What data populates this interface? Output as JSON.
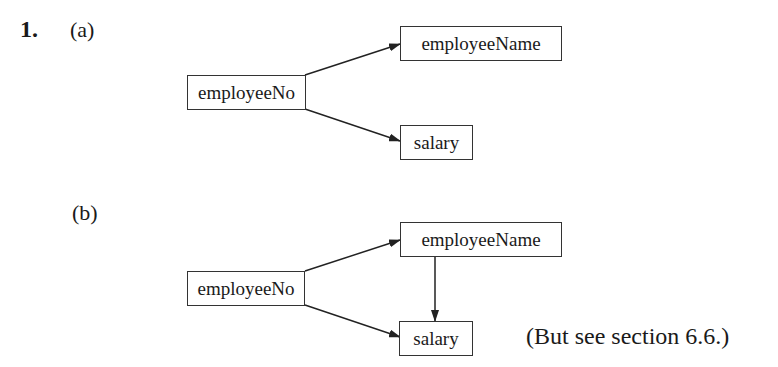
{
  "question": {
    "number": "1.",
    "parts": [
      {
        "label": "(a)",
        "nodes": {
          "employeeNo": "employeeNo",
          "employeeName": "employeeName",
          "salary": "salary"
        },
        "edges": [
          {
            "from": "employeeNo",
            "to": "employeeName"
          },
          {
            "from": "employeeNo",
            "to": "salary"
          }
        ]
      },
      {
        "label": "(b)",
        "nodes": {
          "employeeNo": "employeeNo",
          "employeeName": "employeeName",
          "salary": "salary"
        },
        "edges": [
          {
            "from": "employeeNo",
            "to": "employeeName"
          },
          {
            "from": "employeeNo",
            "to": "salary"
          },
          {
            "from": "employeeName",
            "to": "salary"
          }
        ],
        "note": "(But see section 6.6.)"
      }
    ]
  },
  "colors": {
    "ink": "#1a1a1a",
    "box_border": "#333333",
    "background": "#ffffff"
  }
}
